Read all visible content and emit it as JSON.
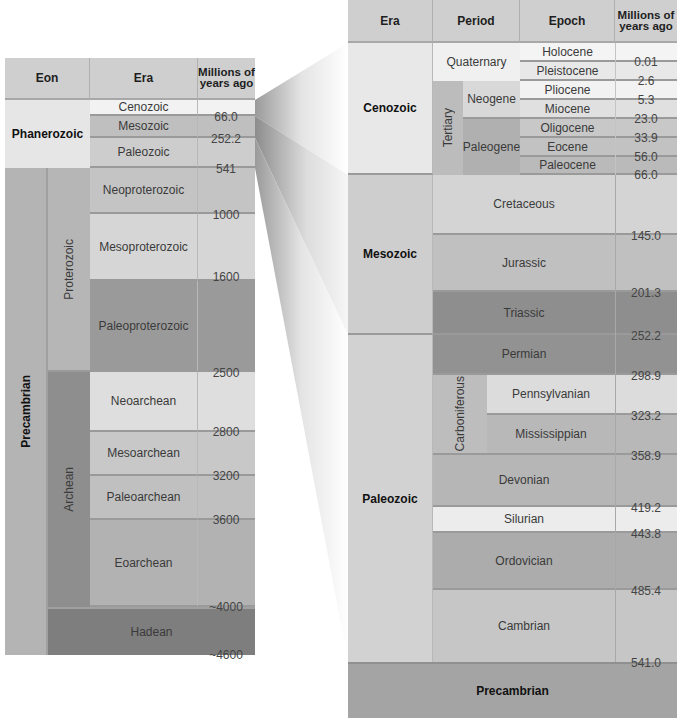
{
  "left_table": {
    "headers": {
      "eon": "Eon",
      "era": "Era",
      "ma": "Millions of years ago"
    },
    "eons": [
      {
        "name": "Phanerozoic"
      },
      {
        "name": "Precambrian",
        "sub": [
          "Proterozoic",
          "Archean"
        ]
      }
    ],
    "eras": [
      "Cenozoic",
      "Mesozoic",
      "Paleozoic",
      "Neoproterozoic",
      "Mesoproterozoic",
      "Paleoproterozoic",
      "Neoarchean",
      "Mesoarchean",
      "Paleoarchean",
      "Eoarchean",
      "Hadean"
    ],
    "ages": [
      "66.0",
      "252.2",
      "541",
      "1000",
      "1600",
      "2500",
      "2800",
      "3200",
      "3600",
      "~4000",
      "~4600"
    ]
  },
  "right_table": {
    "headers": {
      "era": "Era",
      "period": "Period",
      "epoch": "Epoch",
      "ma": "Millions of years ago"
    },
    "eras": [
      "Cenozoic",
      "Mesozoic",
      "Paleozoic",
      "Precambrian"
    ],
    "cenozoic": {
      "quaternary": "Quaternary",
      "tertiary": "Tertiary",
      "neogene": "Neogene",
      "paleogene": "Paleogene",
      "epochs": [
        "Holocene",
        "Pleistocene",
        "Pliocene",
        "Miocene",
        "Oligocene",
        "Eocene",
        "Paleocene"
      ]
    },
    "periods": [
      "Cretaceous",
      "Jurassic",
      "Triassic",
      "Permian",
      "Pennsylvanian",
      "Mississippian",
      "Devonian",
      "Silurian",
      "Ordovician",
      "Cambrian"
    ],
    "carboniferous": "Carboniferous",
    "ages": [
      "0.01",
      "2.6",
      "5.3",
      "23.0",
      "33.9",
      "56.0",
      "66.0",
      "145.0",
      "201.3",
      "252.2",
      "298.9",
      "323.2",
      "358.9",
      "419.2",
      "443.8",
      "485.4",
      "541.0"
    ]
  }
}
